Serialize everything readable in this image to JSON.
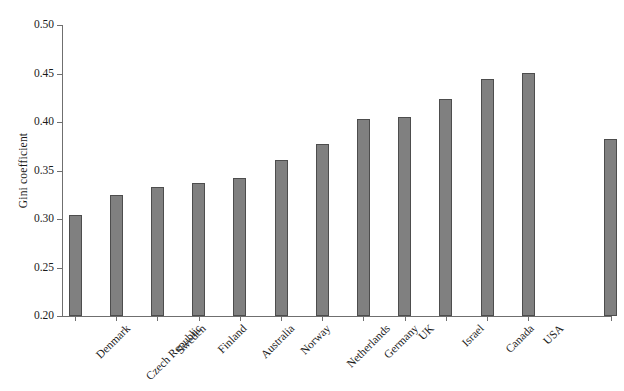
{
  "chart_data": {
    "type": "bar",
    "title": "",
    "subtitle": "",
    "xlabel": "",
    "ylabel": "Gini coefficient",
    "ylim": [
      0.2,
      0.5
    ],
    "ytick_labels": [
      "0.50",
      "0.45",
      "0.40",
      "0.35",
      "0.30",
      "0.25",
      "0.20"
    ],
    "ytick_values": [
      0.5,
      0.45,
      0.4,
      0.35,
      0.3,
      0.25,
      0.2
    ],
    "grid": false,
    "legend": null,
    "legend_position": "none",
    "bar_color": "#808080",
    "bar_edge_color": "#4d4d4d",
    "axis_color": "#6f6f6f",
    "text_color": "#1a1a1a",
    "background_color": "#ffffff",
    "categories": [
      "Denmark",
      "Czech Republic",
      "Sweden",
      "Finland",
      "Australia",
      "Norway",
      "Netherlands",
      "Germany",
      "UK",
      "Israel",
      "Canada",
      "USA",
      "Average"
    ],
    "values": [
      0.304,
      0.325,
      0.333,
      0.337,
      0.342,
      0.361,
      0.377,
      0.403,
      0.405,
      0.424,
      0.444,
      0.451,
      0.382
    ],
    "gap_before_last_category": true
  }
}
